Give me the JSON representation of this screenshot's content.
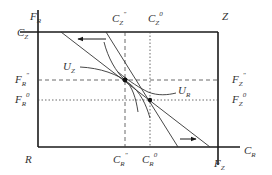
{
  "diagram": {
    "type": "edgeworth-box",
    "colors": {
      "axis": "#1a1a1a",
      "line": "#333333",
      "guide": "#444444",
      "text": "#333333",
      "background": "#ffffff"
    },
    "corners": {
      "origin_R": "R",
      "origin_Z": "Z"
    },
    "axes": {
      "left_top": {
        "main": "F",
        "sub": "R"
      },
      "top_left": {
        "main": "C",
        "sub": "Z"
      },
      "bottom_right": {
        "main": "C",
        "sub": "R"
      },
      "right_bottom": {
        "main": "F",
        "sub": "Z"
      }
    },
    "ticks": {
      "top": [
        {
          "main": "C",
          "sub": "Z",
          "sup": "\"",
          "style": "dashed"
        },
        {
          "main": "C",
          "sub": "Z",
          "sup": "0",
          "style": "dotted"
        }
      ],
      "bottom": [
        {
          "main": "C",
          "sub": "R",
          "sup": "\"",
          "style": "dashed"
        },
        {
          "main": "C",
          "sub": "R",
          "sup": "0",
          "style": "dotted"
        }
      ],
      "left": [
        {
          "main": "F",
          "sub": "R",
          "sup": "\"",
          "style": "dashed"
        },
        {
          "main": "F",
          "sub": "R",
          "sup": "0",
          "style": "dotted"
        }
      ],
      "right": [
        {
          "main": "F",
          "sub": "Z",
          "sup": "\"",
          "style": "dashed"
        },
        {
          "main": "F",
          "sub": "Z",
          "sup": "0",
          "style": "dotted"
        }
      ]
    },
    "curves": [
      {
        "main": "U",
        "sub": "Z"
      },
      {
        "main": "U",
        "sub": "R"
      }
    ],
    "arrows": {
      "top": "left",
      "bottom": "right"
    }
  }
}
